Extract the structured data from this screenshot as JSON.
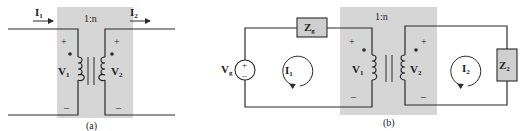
{
  "colors": {
    "shade": "#d6d6d6",
    "wire": "#2a2a2a",
    "box_fill": "#cfcfcf"
  },
  "figure_a": {
    "caption": "(a)",
    "ratio": "1:n",
    "current_in": {
      "main": "I",
      "sub": "1"
    },
    "current_out": {
      "main": "I",
      "sub": "2"
    },
    "primary_voltage": {
      "main": "V",
      "sub": "1"
    },
    "secondary_voltage": {
      "main": "V",
      "sub": "2"
    },
    "plus": "+",
    "minus": "–"
  },
  "figure_b": {
    "caption": "(b)",
    "ratio": "1:n",
    "source": {
      "main": "V",
      "sub": "g"
    },
    "source_impedance": {
      "main": "Z",
      "sub": "g"
    },
    "load_impedance": {
      "main": "Z",
      "sub": "2"
    },
    "loop1_current": {
      "main": "I",
      "sub": "1"
    },
    "loop2_current": {
      "main": "I",
      "sub": "2"
    },
    "primary_voltage": {
      "main": "V",
      "sub": "1"
    },
    "secondary_voltage": {
      "main": "V",
      "sub": "2"
    },
    "plus": "+",
    "minus": "–"
  }
}
